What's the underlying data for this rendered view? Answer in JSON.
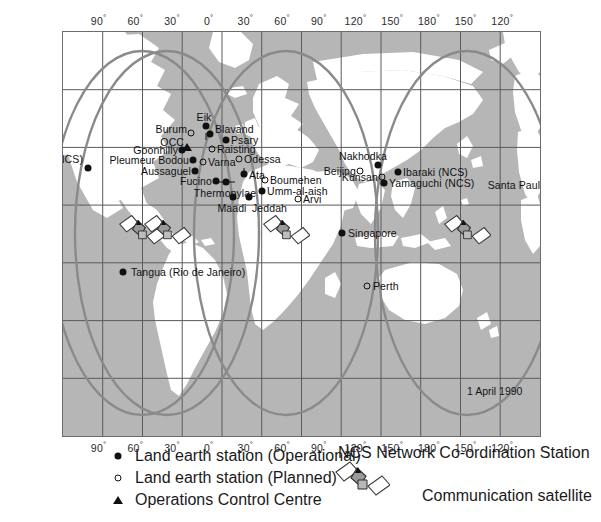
{
  "map": {
    "title_stamp": "1 April 1990",
    "colors": {
      "sea": "#b6b6b6",
      "land": "#ffffff",
      "graticule": "#5a5a5a",
      "coverage_ellipse": "#8a8a8a",
      "marker": "#101010",
      "frame": "#6d6d6d"
    },
    "axis": {
      "top_labels": [
        "90",
        "60",
        "30",
        "0",
        "30",
        "60",
        "90",
        "120",
        "150",
        "180",
        "150",
        "120"
      ],
      "bottom_labels": [
        "90",
        "60",
        "30",
        "0",
        "30",
        "60",
        "90",
        "120",
        "150",
        "180",
        "150",
        "120"
      ],
      "degree_symbol": "°"
    },
    "stations": [
      {
        "name": "Southbury (NCS)",
        "type": "operational",
        "x": 87,
        "y": 167,
        "anchor": "left",
        "lx": 82,
        "ly": 158
      },
      {
        "name": "Santa Paula",
        "type": "operational",
        "x": 550,
        "y": 184,
        "anchor": "left",
        "lx": 545,
        "ly": 184
      },
      {
        "name": "Tangua (Rio de Janeiro)",
        "type": "operational",
        "x": 122,
        "y": 271,
        "anchor": "right",
        "lx": 130,
        "ly": 271
      },
      {
        "name": "Eik",
        "type": "operational",
        "x": 205,
        "y": 125,
        "anchor": "center",
        "lx": 203,
        "ly": 116
      },
      {
        "name": "Burum",
        "type": "planned",
        "x": 190,
        "y": 132,
        "anchor": "left",
        "lx": 186,
        "ly": 128
      },
      {
        "name": "Blavand",
        "type": "operational",
        "x": 209,
        "y": 133,
        "anchor": "right",
        "lx": 214,
        "ly": 128
      },
      {
        "name": "Psary",
        "type": "operational",
        "x": 225,
        "y": 139,
        "anchor": "right",
        "lx": 230,
        "ly": 139
      },
      {
        "name": "Raisting",
        "type": "planned",
        "x": 211,
        "y": 148,
        "anchor": "right",
        "lx": 216,
        "ly": 148
      },
      {
        "name": "OCC",
        "type": "occ",
        "x": 186,
        "y": 146,
        "anchor": "left",
        "lx": 183,
        "ly": 141
      },
      {
        "name": "Goonhilly",
        "type": "operational",
        "x": 181,
        "y": 149,
        "anchor": "left",
        "lx": 177,
        "ly": 149
      },
      {
        "name": "Pleumeur Bodou",
        "type": "operational",
        "x": 192,
        "y": 159,
        "anchor": "left",
        "lx": 188,
        "ly": 159
      },
      {
        "name": "Odessa",
        "type": "planned",
        "x": 238,
        "y": 158,
        "anchor": "right",
        "lx": 243,
        "ly": 158
      },
      {
        "name": "Varna",
        "type": "planned",
        "x": 202,
        "y": 161,
        "anchor": "right",
        "lx": 207,
        "ly": 161
      },
      {
        "name": "Aussaguel",
        "type": "operational",
        "x": 194,
        "y": 170,
        "anchor": "left",
        "lx": 190,
        "ly": 170
      },
      {
        "name": "Ata",
        "type": "operational",
        "x": 243,
        "y": 173,
        "anchor": "right",
        "lx": 248,
        "ly": 174
      },
      {
        "name": "Fucino",
        "type": "operational",
        "x": 215,
        "y": 180,
        "anchor": "left",
        "lx": 211,
        "ly": 180
      },
      {
        "name": "Thermopylae",
        "type": "operational",
        "x": 225,
        "y": 181,
        "anchor": "center",
        "lx": 224,
        "ly": 192
      },
      {
        "name": "Boumehen",
        "type": "planned",
        "x": 264,
        "y": 179,
        "anchor": "right",
        "lx": 269,
        "ly": 179
      },
      {
        "name": "Umm-al-aish",
        "type": "operational",
        "x": 261,
        "y": 190,
        "anchor": "right",
        "lx": 266,
        "ly": 190
      },
      {
        "name": "Maadi",
        "type": "operational",
        "x": 232,
        "y": 196,
        "anchor": "center",
        "lx": 231,
        "ly": 207
      },
      {
        "name": "Jeddah",
        "type": "operational",
        "x": 248,
        "y": 196,
        "anchor": "right",
        "lx": 251,
        "ly": 207
      },
      {
        "name": "Arvi",
        "type": "planned",
        "x": 297,
        "y": 198,
        "anchor": "right",
        "lx": 302,
        "ly": 198
      },
      {
        "name": "Nakhodka",
        "type": "operational",
        "x": 377,
        "y": 164,
        "anchor": "center",
        "lx": 362,
        "ly": 155
      },
      {
        "name": "Beijing",
        "type": "planned",
        "x": 359,
        "y": 170,
        "anchor": "left",
        "lx": 355,
        "ly": 170
      },
      {
        "name": "Kunsan",
        "type": "planned",
        "x": 381,
        "y": 176,
        "anchor": "left",
        "lx": 377,
        "ly": 176
      },
      {
        "name": "Ibaraki (NCS)",
        "type": "operational",
        "x": 397,
        "y": 171,
        "anchor": "right",
        "lx": 402,
        "ly": 171
      },
      {
        "name": "Yamaguchi (NCS)",
        "type": "operational",
        "x": 383,
        "y": 182,
        "anchor": "right",
        "lx": 388,
        "ly": 182
      },
      {
        "name": "Singapore",
        "type": "operational",
        "x": 341,
        "y": 232,
        "anchor": "right",
        "lx": 347,
        "ly": 232
      },
      {
        "name": "Perth",
        "type": "planned",
        "x": 366,
        "y": 285,
        "anchor": "right",
        "lx": 372,
        "ly": 285
      }
    ],
    "satellites": [
      {
        "x": 141,
        "y": 232
      },
      {
        "x": 166,
        "y": 232
      },
      {
        "x": 285,
        "y": 232
      },
      {
        "x": 466,
        "y": 232
      }
    ]
  },
  "legend": {
    "items": [
      {
        "marker": "filled-circle",
        "label": "Land earth station (Operational)"
      },
      {
        "marker": "open-circle",
        "label": "Land earth station (Planned)"
      },
      {
        "marker": "triangle",
        "label": "Operations Control Centre"
      }
    ],
    "ncs_note": "NCS Network Co-ordination Station",
    "satellite_label": "Communication satellite"
  }
}
